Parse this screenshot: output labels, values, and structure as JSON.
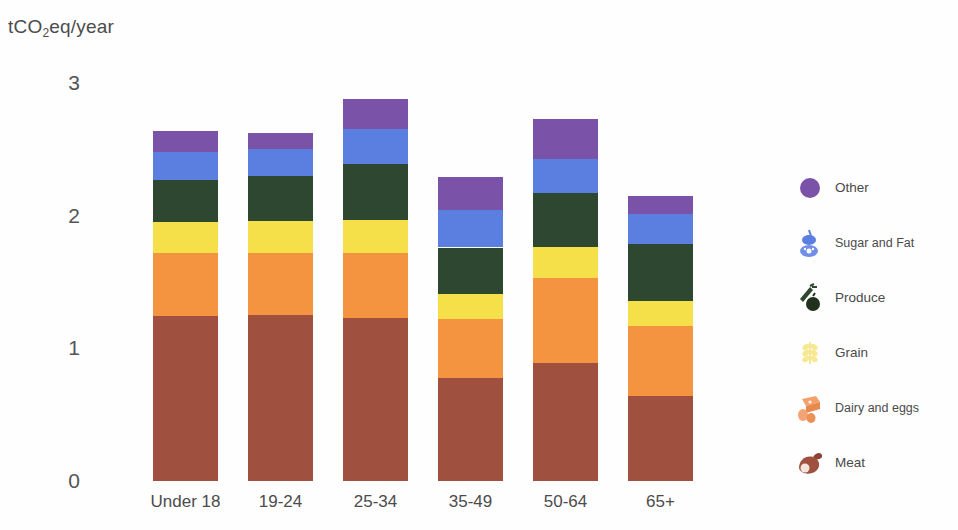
{
  "chart_data": {
    "type": "bar",
    "stacked": true,
    "title": "",
    "subtitle": "",
    "xlabel": "",
    "ylabel": "tCO2eq/year",
    "ylabel_rich": {
      "pre": "tCO",
      "sub": "2",
      "post": "eq/year"
    },
    "ylim": [
      0,
      3
    ],
    "yticks": [
      "0",
      "1",
      "2",
      "3"
    ],
    "ytick_values": [
      0,
      1,
      2,
      3
    ],
    "grid": false,
    "legend_position": "right",
    "categories": [
      "Under 18",
      "19-24",
      "25-34",
      "35-49",
      "50-64",
      "65+"
    ],
    "series": [
      {
        "name": "Meat",
        "color": "#a0503f",
        "values": [
          1.24,
          1.25,
          1.23,
          0.78,
          0.89,
          0.64
        ]
      },
      {
        "name": "Dairy and eggs",
        "color": "#f59440",
        "values": [
          0.48,
          0.47,
          0.49,
          0.44,
          0.64,
          0.53
        ]
      },
      {
        "name": "Grain",
        "color": "#f5e04a",
        "values": [
          0.23,
          0.24,
          0.25,
          0.19,
          0.23,
          0.19
        ]
      },
      {
        "name": "Produce",
        "color": "#2d4730",
        "values": [
          0.32,
          0.34,
          0.42,
          0.35,
          0.41,
          0.43
        ]
      },
      {
        "name": "Sugar and Fat",
        "color": "#5b7fe0",
        "values": [
          0.21,
          0.2,
          0.26,
          0.28,
          0.26,
          0.22
        ]
      },
      {
        "name": "Other",
        "color": "#7a52a8",
        "values": [
          0.16,
          0.12,
          0.23,
          0.25,
          0.3,
          0.14
        ]
      }
    ],
    "totals": [
      2.64,
      2.62,
      2.88,
      2.29,
      2.73,
      2.15
    ],
    "legend": [
      {
        "label": "Other",
        "color": "#7a52a8",
        "icon": "purple-circle-icon"
      },
      {
        "label": "Sugar and Fat",
        "color": "#5b7fe0",
        "icon": "sugar-and-fat-icon"
      },
      {
        "label": "Produce",
        "color": "#2d4730",
        "icon": "produce-icon"
      },
      {
        "label": "Grain",
        "color": "#f5e04a",
        "icon": "grain-icon"
      },
      {
        "label": "Dairy and eggs",
        "color": "#f5a06a",
        "icon": "dairy-and-eggs-icon"
      },
      {
        "label": "Meat",
        "color": "#a0503f",
        "icon": "meat-icon"
      }
    ]
  }
}
